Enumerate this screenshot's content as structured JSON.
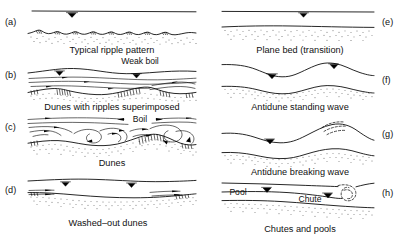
{
  "figure": {
    "background_color": "#ffffff",
    "line_color": "#000000"
  },
  "panels": [
    {
      "id": "a",
      "label": "(a)",
      "caption": "Typical ripple pattern",
      "column": "left",
      "bedform": "ripples",
      "water_surface": "flat",
      "water_level_symbols": 1,
      "inner_labels": []
    },
    {
      "id": "b",
      "label": "(b)",
      "caption": "Dunes with ripples superimposed",
      "column": "left",
      "bedform": "dunes-with-ripples",
      "water_surface": "gently-undulating-out-of-phase",
      "water_level_symbols": 2,
      "inner_labels": [
        {
          "text": "Weak boil",
          "name": "weak-boil-label"
        }
      ]
    },
    {
      "id": "c",
      "label": "(c)",
      "caption": "Dunes",
      "column": "left",
      "bedform": "dunes",
      "water_surface": "undulating-with-boils",
      "water_level_symbols": 0,
      "inner_labels": [
        {
          "text": "Boil",
          "name": "boil-label"
        }
      ]
    },
    {
      "id": "d",
      "label": "(d)",
      "caption": "Washed–out dunes",
      "column": "left",
      "bedform": "washed-out-dunes",
      "water_surface": "nearly-flat",
      "water_level_symbols": 2,
      "inner_labels": []
    },
    {
      "id": "e",
      "label": "(e)",
      "caption": "Plane bed (transition)",
      "column": "right",
      "bedform": "plane-bed",
      "water_surface": "flat",
      "water_level_symbols": 1,
      "inner_labels": []
    },
    {
      "id": "f",
      "label": "(f)",
      "caption": "Antidune standing wave",
      "column": "right",
      "bedform": "antidune",
      "water_surface": "standing-wave-in-phase",
      "water_level_symbols": 2,
      "inner_labels": []
    },
    {
      "id": "g",
      "label": "(g)",
      "caption": "Antidune  breaking wave",
      "column": "right",
      "bedform": "antidune",
      "water_surface": "breaking-wave",
      "water_level_symbols": 1,
      "inner_labels": []
    },
    {
      "id": "h",
      "label": "(h)",
      "caption": "Chutes and pools",
      "column": "right",
      "bedform": "chutes-and-pools",
      "water_surface": "hydraulic-jump",
      "water_level_symbols": 2,
      "inner_labels": [
        {
          "text": "Pool",
          "name": "pool-label"
        },
        {
          "text": "Chute",
          "name": "chute-label"
        }
      ]
    }
  ]
}
